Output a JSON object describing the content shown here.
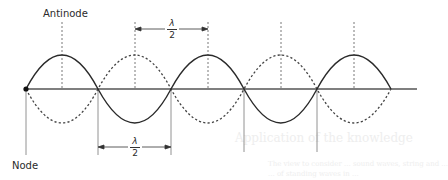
{
  "diagram": {
    "labels": {
      "antinode": "Antinode",
      "node": "Node"
    },
    "half_wavelength": {
      "numerator": "λ",
      "denominator": "2"
    },
    "colors": {
      "line": "#3a3a3a",
      "dashed": "#555555",
      "axis": "#555555",
      "text": "#2a2a2a"
    },
    "ghost_text": {
      "heading": "Application of the knowledge",
      "line1": "The view to consider ... sound waves, string and ...",
      "line2": "... of standing waves in ..."
    }
  }
}
